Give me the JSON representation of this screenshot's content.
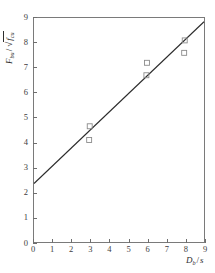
{
  "chart_data": {
    "type": "scatter",
    "title": "",
    "xlabel": "D_b / s",
    "ylabel": "F_bu / sqrt(f_cu)",
    "xlabel_parts": {
      "var": "D",
      "sub": "b",
      "sep": "/",
      "den": "s"
    },
    "ylabel_parts": {
      "var": "F",
      "sub": "bu",
      "sep": "/",
      "radical": "f",
      "radical_sub": "cu"
    },
    "xlim": [
      0,
      9
    ],
    "ylim": [
      0,
      9
    ],
    "xticks": [
      0,
      1,
      2,
      3,
      4,
      5,
      6,
      7,
      8,
      9
    ],
    "yticks": [
      0,
      1,
      2,
      3,
      4,
      5,
      6,
      7,
      8,
      9
    ],
    "xtick_labels": [
      "0",
      "1",
      "2",
      "3",
      "4",
      "5",
      "6",
      "7",
      "8",
      "9"
    ],
    "ytick_labels": [
      "0",
      "1",
      "2",
      "3",
      "4",
      "5",
      "6",
      "7",
      "8",
      "9"
    ],
    "grid": false,
    "legend": null,
    "marker": "open-square",
    "marker_color": "#8a8a8a",
    "line_color": "#2b2b2b",
    "frame_color": "#7a7a7a",
    "points": [
      {
        "x": 2.95,
        "y": 4.65
      },
      {
        "x": 2.92,
        "y": 4.1
      },
      {
        "x": 5.98,
        "y": 7.2
      },
      {
        "x": 5.95,
        "y": 6.7
      },
      {
        "x": 7.98,
        "y": 8.1
      },
      {
        "x": 7.95,
        "y": 7.6
      }
    ],
    "series": [
      {
        "name": "measured",
        "x": [
          2.95,
          2.92,
          5.98,
          5.95,
          7.98,
          7.95
        ],
        "values": [
          4.65,
          4.1,
          7.2,
          6.7,
          8.1,
          7.6
        ]
      }
    ],
    "fit_line": {
      "name": "linear fit",
      "x0": 0,
      "y0": 2.35,
      "x1": 9,
      "y1": 8.85,
      "slope": 0.722,
      "intercept": 2.35
    }
  }
}
